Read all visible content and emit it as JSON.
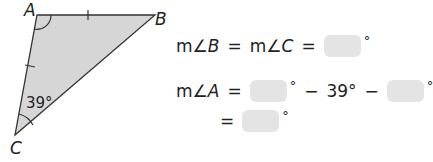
{
  "figure": {
    "vertices": {
      "A": "A",
      "B": "B",
      "C": "C"
    },
    "angle_C_label": "39°",
    "fill_color": "#d6d6d6",
    "stroke_color": "#333333"
  },
  "equations": {
    "line1": {
      "lhs_prefix": "m∠",
      "lhs_var": "B",
      "eq1": "=",
      "mid_prefix": "m∠",
      "mid_var": "C",
      "eq2": "=",
      "box_value": "",
      "deg": "°"
    },
    "line2": {
      "lhs_prefix": "m∠",
      "lhs_var": "A",
      "eq": "=",
      "box1_value": "",
      "deg1": "°",
      "minus1": "−",
      "given": "39°",
      "minus2": "−",
      "box2_value": "",
      "deg2": "°"
    },
    "line3": {
      "eq": "=",
      "box_value": "",
      "deg": "°"
    }
  }
}
